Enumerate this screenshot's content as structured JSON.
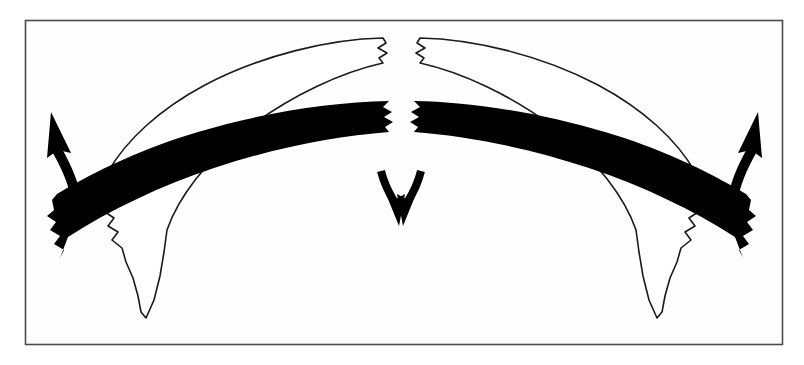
{
  "figure": {
    "domain": "diagram",
    "kind": "structural-geology-cross-section",
    "title": "Folded and extended layered sequence (anticline with crestal extension)",
    "caption": "",
    "background_color": "#ffffff",
    "canvas": {
      "width": 804,
      "height": 365
    }
  },
  "frame": {
    "name": "figure-border",
    "x": 25,
    "y": 20,
    "width": 758,
    "height": 325,
    "stroke_color": "#4a4a4a",
    "stroke_width": 1.6,
    "fill_color": "#fefefe"
  },
  "layers": [
    {
      "id": "upper-band",
      "label": "Upper outlined competent layer",
      "fill_color": "#ffffff",
      "stroke_color": "#1a1a1a",
      "stroke_width": 1.5,
      "broken_at_crest": true,
      "edge_style": "jagged-torn",
      "limb_termination": "jagged-torn",
      "segments": [
        "left-limb",
        "right-limb"
      ]
    },
    {
      "id": "lower-band",
      "label": "Lower solid black competent layer",
      "fill_color": "#000000",
      "stroke_color": "#000000",
      "stroke_width": 0,
      "broken_at_crest": true,
      "edge_style": "jagged-torn",
      "limb_termination": "jagged-torn",
      "segments": [
        "left-limb",
        "right-limb"
      ]
    }
  ],
  "arrows": [
    {
      "id": "arrow-left-up",
      "label": "Left upward extension arrow",
      "direction": "up",
      "curvature": "convex-right",
      "color": "#000000",
      "anchor_x": 58,
      "anchor_y": 155
    },
    {
      "id": "arrow-right-up",
      "label": "Right upward extension arrow",
      "direction": "up",
      "curvature": "convex-left",
      "color": "#000000",
      "anchor_x": 750,
      "anchor_y": 155
    },
    {
      "id": "arrow-center-down-left",
      "label": "Central left-converging downward arrow",
      "direction": "down",
      "curvature": "convex-left",
      "color": "#000000",
      "anchor_x": 392,
      "anchor_y": 200
    },
    {
      "id": "arrow-center-down-right",
      "label": "Central right-converging downward arrow",
      "direction": "down",
      "curvature": "convex-right",
      "color": "#000000",
      "anchor_x": 412,
      "anchor_y": 200
    }
  ],
  "artifacts": {
    "scan_bleed_color": "#e8d9d6",
    "description": "Faint pinkish bleed-through from reverse page of scanned document"
  },
  "colors": {
    "ink": "#000000",
    "border": "#4a4a4a",
    "paper": "#ffffff"
  }
}
